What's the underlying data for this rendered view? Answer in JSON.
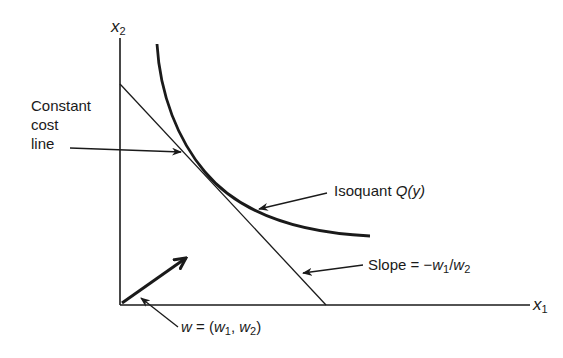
{
  "diagram": {
    "type": "economics-cost-minimization",
    "axes": {
      "x_label": "x",
      "x_sub": "1",
      "y_label": "x",
      "y_sub": "2"
    },
    "labels": {
      "cost_line": [
        "Constant",
        "cost",
        "line"
      ],
      "isoquant_prefix": "Isoquant ",
      "isoquant_fn": "Q(y)",
      "slope_prefix": "Slope = −",
      "slope_w1": "w",
      "slope_w1_sub": "1",
      "slope_sep": "/",
      "slope_w2": "w",
      "slope_w2_sub": "2",
      "vector_w": "w",
      "vector_eq": " = (",
      "vector_w1": "w",
      "vector_w1_sub": "1",
      "vector_comma": ", ",
      "vector_w2": "w",
      "vector_w2_sub": "2",
      "vector_close": ")"
    },
    "colors": {
      "ink": "#1a1a1a",
      "background": "#ffffff"
    }
  }
}
